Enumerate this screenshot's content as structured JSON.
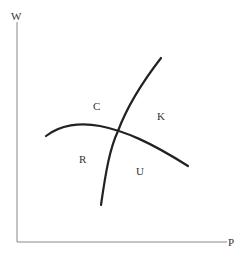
{
  "diagram": {
    "axes": {
      "y_label": "W",
      "x_label": "P"
    },
    "region_labels": {
      "top_left": "C",
      "top_right": "K",
      "bottom_left": "R",
      "bottom_right": "U"
    },
    "curves": [
      {
        "name": "steep-upward-curve",
        "description": "rises steeply from lower-left to upper-right"
      },
      {
        "name": "downward-sloping-curve",
        "description": "arched curve sloping downward to the right"
      }
    ],
    "colors": {
      "axis": "#888888",
      "curve": "#222222",
      "text": "#333333"
    }
  }
}
